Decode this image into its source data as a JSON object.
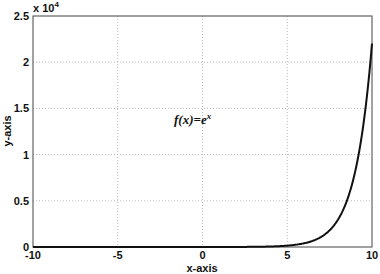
{
  "chart_data": {
    "type": "line",
    "title": "",
    "xlabel": "x-axis",
    "ylabel": "y-axis",
    "xlim": [
      -10,
      10
    ],
    "ylim": [
      0,
      25000
    ],
    "y_multiplier_label": "x 10",
    "y_multiplier_exponent": "4",
    "x_ticks": [
      "-10",
      "-5",
      "0",
      "5",
      "10"
    ],
    "y_ticks": [
      "0",
      "0.5",
      "1",
      "1.5",
      "2",
      "2.5"
    ],
    "grid": true,
    "annotation": {
      "text": "f(x)=e",
      "superscript": "x",
      "x": 0,
      "y": 15000
    },
    "series": [
      {
        "name": "f(x)=e^x",
        "color": "#111111",
        "x": [
          -10,
          -5,
          0,
          2,
          4,
          5,
          6,
          7,
          7.5,
          8,
          8.5,
          9,
          9.5,
          10
        ],
        "values": [
          4.54e-05,
          0.0067,
          1,
          7.39,
          54.6,
          148.4,
          403.4,
          1096.6,
          1808,
          2981,
          4914,
          8103,
          13360,
          22026
        ]
      }
    ]
  }
}
